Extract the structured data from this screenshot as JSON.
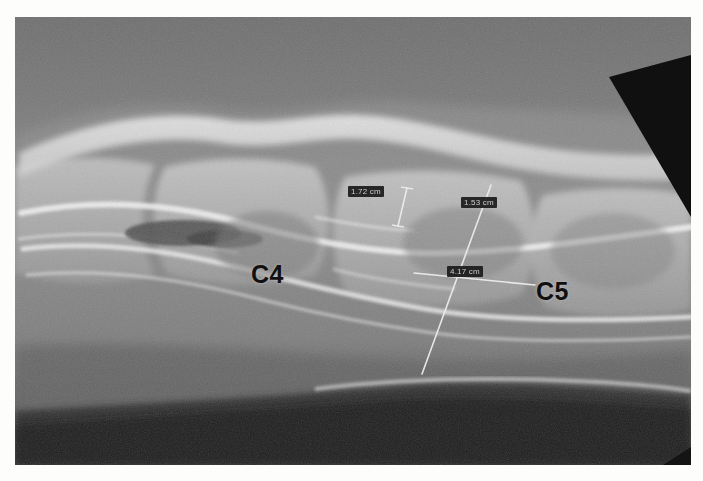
{
  "image": {
    "modality": "radiograph",
    "view": "lateral cervical spine",
    "frame": {
      "left": 15,
      "top": 17,
      "width": 676,
      "height": 448
    },
    "background_color": "#ffffff",
    "plate_base_color": "#6a6a6a"
  },
  "annotations": {
    "vertebra_labels": [
      {
        "name": "c4-label",
        "text": "C4",
        "x": 236,
        "y": 245
      },
      {
        "name": "c5-label",
        "text": "C5",
        "x": 521,
        "y": 262
      }
    ],
    "measurements": [
      {
        "name": "measurement-1",
        "text": "1.72 cm",
        "label_x": 333,
        "label_y": 169,
        "line": {
          "x1": 392,
          "y1": 171,
          "x2": 383,
          "y2": 209
        },
        "color": "#e8e8e8"
      },
      {
        "name": "measurement-2",
        "text": "1.53 cm",
        "label_x": 446,
        "label_y": 180,
        "line": {
          "x1": 476,
          "y1": 168,
          "x2": 407,
          "y2": 357
        },
        "color": "#e8e8e8"
      },
      {
        "name": "measurement-3",
        "text": "4.17 cm",
        "label_x": 432,
        "label_y": 249,
        "line": {
          "x1": 399,
          "y1": 256,
          "x2": 520,
          "y2": 268
        },
        "color": "#e8e8e8"
      }
    ]
  },
  "colors": {
    "label_background": "#1b1b1b",
    "label_text": "#cfcfcf",
    "vertebra_text": "#101010",
    "measurement_line": "#e8e8e8",
    "dark_band": "#2a2a2a",
    "corner_triangle": "#111111"
  }
}
